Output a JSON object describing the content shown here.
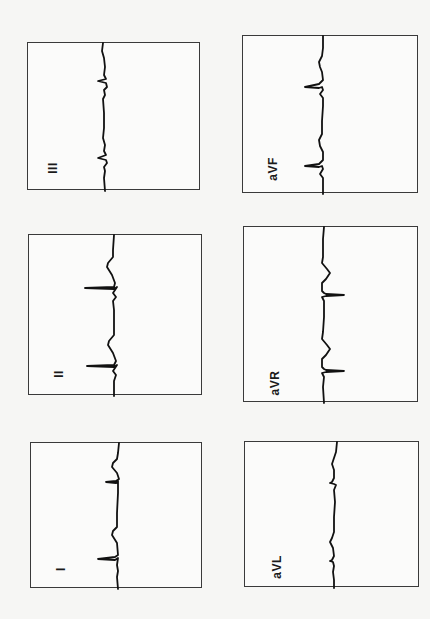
{
  "figure": {
    "orientation": "rotated-90",
    "panels": [
      {
        "id": "III",
        "label": "III",
        "box": [
          27,
          42,
          173,
          148
        ],
        "label_pos": [
          25,
          125
        ]
      },
      {
        "id": "aVF",
        "label": "aVF",
        "box": [
          242,
          35,
          176,
          158
        ],
        "label_pos": [
          30,
          133
        ]
      },
      {
        "id": "II",
        "label": "II",
        "box": [
          28,
          234,
          174,
          161
        ],
        "label_pos": [
          30,
          139
        ]
      },
      {
        "id": "aVR",
        "label": "aVR",
        "box": [
          243,
          226,
          175,
          176
        ],
        "label_pos": [
          31,
          156
        ]
      },
      {
        "id": "I",
        "label": "I",
        "box": [
          30,
          442,
          172,
          146
        ],
        "label_pos": [
          30,
          126
        ]
      },
      {
        "id": "aVL",
        "label": "aVL",
        "box": [
          244,
          441,
          175,
          146
        ],
        "label_pos": [
          32,
          125
        ]
      }
    ],
    "colors": {
      "trace": "#111111",
      "frame": "#3a3a3a",
      "background": "#f6f6f4"
    }
  }
}
